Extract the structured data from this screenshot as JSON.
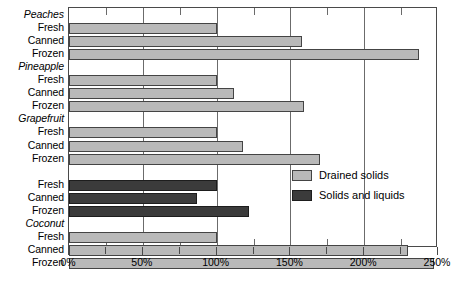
{
  "chart_data": {
    "type": "bar",
    "orientation": "horizontal",
    "title": "",
    "subtitle": "",
    "xlabel": "",
    "ylabel": "",
    "xlim": [
      0,
      250
    ],
    "xunit": "%",
    "xticks": [
      0,
      50,
      100,
      150,
      200,
      250
    ],
    "xticklabels": [
      "0%",
      "50%",
      "100%",
      "150%",
      "200%",
      "250%"
    ],
    "minor_tick_interval": 25,
    "grid": "vertical",
    "legend_position": "inside-right",
    "legend": [
      {
        "name": "Drained solids",
        "color": "#b9b9b9"
      },
      {
        "name": "Solids and liquids",
        "color": "#3b3b3b"
      }
    ],
    "groups": [
      {
        "name": "Peaches",
        "series": "Drained solids",
        "categories": [
          "Fresh",
          "Canned",
          "Frozen"
        ],
        "values": [
          100,
          158,
          237
        ]
      },
      {
        "name": "Pineapple",
        "series": "Drained solids",
        "categories": [
          "Fresh",
          "Canned",
          "Frozen"
        ],
        "values": [
          100,
          112,
          159
        ]
      },
      {
        "name": "Grapefruit",
        "series": "Drained solids",
        "categories": [
          "Fresh",
          "Canned",
          "Frozen"
        ],
        "values": [
          100,
          118,
          170
        ]
      },
      {
        "name": "",
        "series": "Solids and liquids",
        "categories": [
          "Fresh",
          "Canned",
          "Frozen"
        ],
        "values": [
          100,
          87,
          122
        ]
      },
      {
        "name": "Coconut",
        "series": "Drained solids",
        "categories": [
          "Fresh",
          "Canned",
          "Frozen"
        ],
        "values": [
          100,
          230,
          247
        ]
      }
    ]
  }
}
